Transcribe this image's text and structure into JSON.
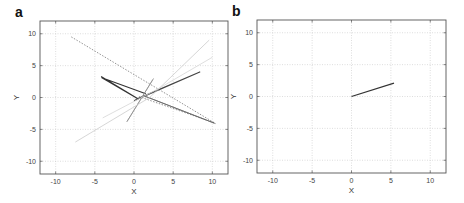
{
  "chart_data": [
    {
      "type": "line",
      "panel_label": "a",
      "title": "",
      "xlabel": "X",
      "ylabel": "Y",
      "xlim": [
        -12,
        12
      ],
      "ylim": [
        -12,
        12
      ],
      "xticks": [
        -10,
        -5,
        0,
        5,
        10
      ],
      "yticks": [
        -10,
        -5,
        0,
        5,
        10
      ],
      "grid": true,
      "legend": null,
      "series": [
        {
          "name": "trajectory-dotted",
          "color": "#777777",
          "dash": "1.5,1.5",
          "width": 0.8,
          "points": [
            [
              -8,
              9.5
            ],
            [
              10.3,
              -4
            ],
            [
              0.5,
              0.2
            ]
          ]
        },
        {
          "name": "trajectory-dark-1",
          "color": "#333333",
          "dash": "",
          "width": 1.1,
          "points": [
            [
              -4.2,
              3.3
            ],
            [
              0.5,
              -0.2
            ],
            [
              -4.1,
              3.1
            ],
            [
              1.5,
              0.6
            ]
          ]
        },
        {
          "name": "trajectory-dark-2",
          "color": "#444444",
          "dash": "",
          "width": 1.1,
          "points": [
            [
              0,
              -0.5
            ],
            [
              8.4,
              4
            ],
            [
              0.2,
              -0.3
            ]
          ]
        },
        {
          "name": "trajectory-mid",
          "color": "#666666",
          "dash": "",
          "width": 0.8,
          "points": [
            [
              10.2,
              -4
            ],
            [
              1.2,
              0.3
            ],
            [
              10.4,
              -4.1
            ]
          ]
        },
        {
          "name": "trajectory-loop",
          "color": "#888888",
          "dash": "",
          "width": 0.7,
          "points": [
            [
              2.5,
              3
            ],
            [
              -0.9,
              -3.8
            ],
            [
              -0.6,
              -3.2
            ],
            [
              2.4,
              2.8
            ]
          ]
        },
        {
          "name": "trajectory-light-1",
          "color": "#cccccc",
          "dash": "",
          "width": 0.8,
          "points": [
            [
              -7.5,
              -7
            ],
            [
              2,
              0
            ],
            [
              9.6,
              9
            ]
          ]
        },
        {
          "name": "trajectory-light-2",
          "color": "#d6d6d6",
          "dash": "",
          "width": 0.8,
          "points": [
            [
              -4,
              -3.2
            ],
            [
              3,
              1.3
            ],
            [
              10,
              6.3
            ]
          ]
        }
      ]
    },
    {
      "type": "line",
      "panel_label": "b",
      "title": "",
      "xlabel": "X",
      "ylabel": "Y",
      "xlim": [
        -12,
        12
      ],
      "ylim": [
        -12,
        12
      ],
      "xticks": [
        -10,
        -5,
        0,
        5,
        10
      ],
      "yticks": [
        -10,
        -5,
        0,
        5,
        10
      ],
      "grid": true,
      "legend": null,
      "series": [
        {
          "name": "trajectory",
          "color": "#333333",
          "dash": "",
          "width": 1.2,
          "points": [
            [
              0,
              0
            ],
            [
              5.4,
              2.1
            ]
          ]
        }
      ]
    }
  ],
  "panels": [
    {
      "label": "a",
      "xlabel": "X",
      "ylabel": "Y"
    },
    {
      "label": "b",
      "xlabel": "X",
      "ylabel": "Y"
    }
  ]
}
